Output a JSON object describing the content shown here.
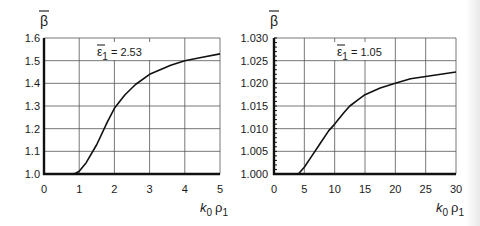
{
  "chart_data": [
    {
      "type": "line",
      "title": "",
      "ylabel": "β̄",
      "xlabel": "k0 ρ1",
      "xlabel_parts": {
        "k": "k",
        "k_sub": "0",
        "rho": "ρ",
        "rho_sub": "1"
      },
      "annotation": {
        "symbol": "ε̄",
        "sub": "1",
        "text": "= 2.53"
      },
      "xlim": [
        0,
        5
      ],
      "ylim": [
        1.0,
        1.6
      ],
      "x_ticks": [
        0,
        1,
        2,
        3,
        4,
        5
      ],
      "x_tick_labels": [
        "0",
        "1",
        "2",
        "3",
        "4",
        "5"
      ],
      "y_ticks": [
        1.0,
        1.1,
        1.2,
        1.3,
        1.4,
        1.5,
        1.6
      ],
      "y_tick_labels": [
        "1.0",
        "1.1",
        "1.2",
        "1.3",
        "1.4",
        "1.5",
        "1.6"
      ],
      "grid": true,
      "series": [
        {
          "name": "ε̄1 = 2.53",
          "x": [
            0.8,
            0.9,
            1.0,
            1.2,
            1.5,
            1.8,
            2.0,
            2.3,
            2.6,
            3.0,
            3.3,
            3.6,
            4.0,
            4.5,
            5.0
          ],
          "values": [
            1.0,
            1.003,
            1.012,
            1.05,
            1.13,
            1.23,
            1.29,
            1.35,
            1.395,
            1.44,
            1.46,
            1.48,
            1.5,
            1.515,
            1.53
          ]
        }
      ]
    },
    {
      "type": "line",
      "title": "",
      "ylabel": "β̄",
      "xlabel": "k0 ρ1",
      "xlabel_parts": {
        "k": "k",
        "k_sub": "0",
        "rho": "ρ",
        "rho_sub": "1"
      },
      "annotation": {
        "symbol": "ε̄",
        "sub": "1",
        "text": "= 1.05"
      },
      "xlim": [
        0,
        30
      ],
      "ylim": [
        1.0,
        1.03
      ],
      "x_ticks": [
        0,
        5,
        10,
        15,
        20,
        25,
        30
      ],
      "x_tick_labels": [
        "0",
        "5",
        "10",
        "15",
        "20",
        "25",
        "30"
      ],
      "y_ticks": [
        1.0,
        1.005,
        1.01,
        1.015,
        1.02,
        1.025,
        1.03
      ],
      "y_tick_labels": [
        "1.000",
        "1.005",
        "1.010",
        "1.015",
        "1.020",
        "1.025",
        "1.030"
      ],
      "grid": true,
      "series": [
        {
          "name": "ε̄1 = 1.05",
          "x": [
            4.0,
            5.0,
            6.0,
            7.5,
            9.0,
            10.0,
            11.5,
            12.5,
            14.0,
            15.0,
            17.5,
            20.0,
            22.5,
            25.0,
            27.5,
            30.0
          ],
          "values": [
            1.0,
            1.0015,
            1.0035,
            1.0065,
            1.0095,
            1.011,
            1.0135,
            1.015,
            1.0165,
            1.0175,
            1.019,
            1.02,
            1.021,
            1.0215,
            1.022,
            1.0225
          ]
        }
      ]
    }
  ]
}
